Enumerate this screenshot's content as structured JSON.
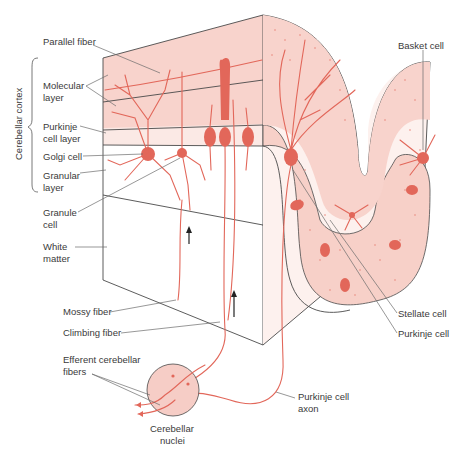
{
  "diagram": {
    "colors": {
      "neuron": "#e2675a",
      "molecular_fill": "#f8d3cc",
      "purkinje_band_fill": "#fbe9e5",
      "folia_fill": "#f7d0c8",
      "nuclei_fill": "#f6cdc6",
      "outline": "#4a4a4a",
      "label_text": "#3a3a3a"
    },
    "brace_label": "Cerebellar cortex",
    "labels_left": {
      "parallel_fiber": "Parallel fiber",
      "molecular_layer_1": "Molecular",
      "molecular_layer_2": "layer",
      "purkinje_layer_1": "Purkinje",
      "purkinje_layer_2": "cell layer",
      "golgi_cell": "Golgi cell",
      "granular_layer_1": "Granular",
      "granular_layer_2": "layer",
      "granule_cell_1": "Granule",
      "granule_cell_2": "cell",
      "white_matter_1": "White",
      "white_matter_2": "matter",
      "mossy_fiber": "Mossy fiber",
      "climbing_fiber": "Climbing fiber",
      "efferent_1": "Efferent cerebellar",
      "efferent_2": "fibers"
    },
    "labels_bottom": {
      "nuclei_1": "Cerebellar",
      "nuclei_2": "nuclei",
      "axon_1": "Purkinje cell",
      "axon_2": "axon"
    },
    "labels_right": {
      "basket_cell": "Basket cell",
      "stellate_cell": "Stellate cell",
      "purkinje_cell": "Purkinje cell"
    }
  }
}
